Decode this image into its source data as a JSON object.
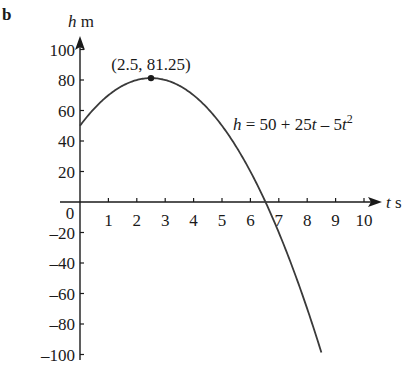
{
  "part_label": "b",
  "chart_data": {
    "type": "line",
    "title": "",
    "function": "h = 50 + 25t - 5t^2",
    "equation_label": {
      "lhs": "h",
      "rhs_parts": [
        "= 50 + 25",
        "t",
        " – 5",
        "t",
        "2"
      ]
    },
    "xlabel": {
      "var": "t",
      "unit": "s"
    },
    "ylabel": {
      "var": "h",
      "unit": "m"
    },
    "x_ticks": [
      1,
      2,
      3,
      4,
      5,
      6,
      7,
      8,
      9,
      10
    ],
    "y_ticks": [
      100,
      80,
      60,
      40,
      20,
      -20,
      -40,
      -60,
      -80,
      -100
    ],
    "origin_label": "0",
    "xlim": [
      0,
      10
    ],
    "ylim": [
      -100,
      100
    ],
    "x_domain": [
      0,
      8.5
    ],
    "grid": false,
    "legend": null,
    "annotations": [
      {
        "type": "point",
        "x": 2.5,
        "y": 81.25,
        "label": "(2.5, 81.25)"
      }
    ],
    "series": [
      {
        "name": "h = 50 + 25t - 5t^2",
        "x": [
          0,
          0.5,
          1,
          1.5,
          2,
          2.5,
          3,
          3.5,
          4,
          4.5,
          5,
          5.5,
          6,
          6.5,
          7,
          7.5,
          8,
          8.5
        ],
        "values": [
          50,
          61.25,
          70,
          76.25,
          80,
          81.25,
          80,
          76.25,
          70,
          61.25,
          50,
          36.25,
          20,
          1.25,
          -20,
          -43.75,
          -70,
          -98.75
        ]
      }
    ]
  },
  "colors": {
    "axis": "#1a1a1a",
    "curve": "#3a3a3a",
    "text": "#1a1a1a",
    "background": "#ffffff"
  }
}
